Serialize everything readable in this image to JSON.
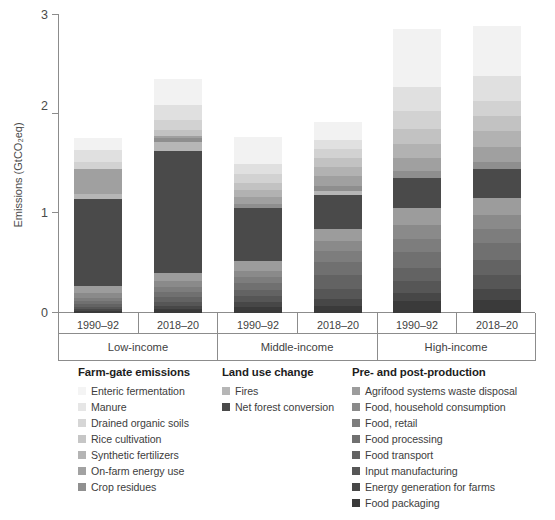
{
  "chart_data": {
    "type": "bar",
    "subtype": "stacked-bar-grouped",
    "title": "",
    "xlabel": "",
    "ylabel": "Emissions (GtCO₂eq)",
    "ylim": [
      0,
      3
    ],
    "yticks": [
      0,
      1,
      2,
      3
    ],
    "ytick_labels": [
      "0",
      "1",
      "2",
      "3"
    ],
    "grid": false,
    "legend_position": "below-plot",
    "groups": [
      "Low-income",
      "Middle-income",
      "High-income"
    ],
    "categories": [
      "1990–92",
      "2018–20",
      "1990–92",
      "2018–20",
      "1990–92",
      "2018–20"
    ],
    "bars": [
      {
        "group": "Low-income",
        "period": "1990–92",
        "total": 1.68
      },
      {
        "group": "Low-income",
        "period": "2018–20",
        "total": 2.65
      },
      {
        "group": "Middle-income",
        "period": "1990–92",
        "total": 1.66
      },
      {
        "group": "Middle-income",
        "period": "2018–20",
        "total": 1.87
      },
      {
        "group": "High-income",
        "period": "1990–92",
        "total": 2.75
      },
      {
        "group": "High-income",
        "period": "2018–20",
        "total": 2.83
      }
    ],
    "series": [
      {
        "name": "Enteric fermentation",
        "color": "#f2f2f2",
        "values": [
          0.12,
          0.26,
          0.27,
          0.18,
          0.58,
          0.5
        ]
      },
      {
        "name": "Manure",
        "color": "#e0e0e0",
        "values": [
          0.12,
          0.16,
          0.1,
          0.09,
          0.24,
          0.25
        ]
      },
      {
        "name": "Drained organic soils",
        "color": "#d2d2d2",
        "values": [
          0.07,
          0.1,
          0.09,
          0.09,
          0.19,
          0.16
        ]
      },
      {
        "name": "Rice cultivation",
        "color": "#c2c2c2",
        "values": [
          0.0,
          0.06,
          0.07,
          0.09,
          0.15,
          0.15
        ]
      },
      {
        "name": "Synthetic fertilizers",
        "color": "#b2b2b2",
        "values": [
          0.0,
          0.0,
          0.07,
          0.09,
          0.14,
          0.16
        ]
      },
      {
        "name": "On-farm energy use",
        "color": "#a0a0a0",
        "values": [
          0.25,
          0.02,
          0.07,
          0.1,
          0.13,
          0.15
        ]
      },
      {
        "name": "Crop residues",
        "color": "#8e8e8e",
        "values": [
          0.0,
          0.04,
          0.04,
          0.05,
          0.07,
          0.07
        ]
      },
      {
        "name": "Fires",
        "color": "#b6b6b6",
        "values": [
          0.05,
          0.09,
          0.0,
          0.04,
          0.0,
          0.0
        ]
      },
      {
        "name": "Net forest conversion",
        "color": "#4a4a4a",
        "values": [
          0.87,
          1.22,
          0.53,
          0.34,
          0.3,
          0.29
        ]
      },
      {
        "name": "Agrifood systems waste disposal",
        "color": "#9c9c9c",
        "values": [
          0.07,
          0.08,
          0.1,
          0.12,
          0.17,
          0.17
        ]
      },
      {
        "name": "Food, household consumption",
        "color": "#8a8a8a",
        "values": [
          0.05,
          0.06,
          0.06,
          0.1,
          0.14,
          0.14
        ]
      },
      {
        "name": "Food, retail",
        "color": "#7d7d7d",
        "values": [
          0.03,
          0.05,
          0.06,
          0.11,
          0.13,
          0.14
        ]
      },
      {
        "name": "Food processing",
        "color": "#707070",
        "values": [
          0.03,
          0.05,
          0.07,
          0.13,
          0.16,
          0.17
        ]
      },
      {
        "name": "Food transport",
        "color": "#636363",
        "values": [
          0.03,
          0.05,
          0.06,
          0.14,
          0.13,
          0.15
        ]
      },
      {
        "name": "Input manufacturing",
        "color": "#565656",
        "values": [
          0.02,
          0.04,
          0.06,
          0.1,
          0.12,
          0.14
        ]
      },
      {
        "name": "Energy generation for farms",
        "color": "#474747",
        "values": [
          0.02,
          0.03,
          0.05,
          0.07,
          0.08,
          0.11
        ]
      },
      {
        "name": "Food packaging",
        "color": "#3a3a3a",
        "values": [
          0.02,
          0.04,
          0.06,
          0.07,
          0.12,
          0.13
        ]
      }
    ]
  },
  "axis": {
    "ylabel": "Emissions (GtCO₂eq)",
    "ytick_0": "0",
    "ytick_1": "1",
    "ytick_2": "2",
    "ytick_3": "3"
  },
  "xaxis": {
    "periods": [
      {
        "label": "1990–92"
      },
      {
        "label": "2018–20"
      },
      {
        "label": "1990–92"
      },
      {
        "label": "2018–20"
      },
      {
        "label": "1990–92"
      },
      {
        "label": "2018–20"
      }
    ],
    "groups": [
      {
        "label": "Low-income"
      },
      {
        "label": "Middle-income"
      },
      {
        "label": "High-income"
      }
    ]
  },
  "legend": {
    "columns": [
      {
        "title": "Farm-gate emissions",
        "items": [
          {
            "label": "Enteric fermentation",
            "color": "#f4f4f4"
          },
          {
            "label": "Manure",
            "color": "#e6e6e6"
          },
          {
            "label": "Drained organic soils",
            "color": "#d6d6d6"
          },
          {
            "label": "Rice cultivation",
            "color": "#c6c6c6"
          },
          {
            "label": "Synthetic fertilizers",
            "color": "#b4b4b4"
          },
          {
            "label": "On-farm energy use",
            "color": "#a2a2a2"
          },
          {
            "label": "Crop residues",
            "color": "#909090"
          }
        ]
      },
      {
        "title": "Land use change",
        "items": [
          {
            "label": "Fires",
            "color": "#b6b6b6"
          },
          {
            "label": "Net forest conversion",
            "color": "#4a4a4a"
          }
        ]
      },
      {
        "title": "Pre- and post-production",
        "items": [
          {
            "label": "Agrifood systems waste disposal",
            "color": "#9c9c9c"
          },
          {
            "label": "Food, household consumption",
            "color": "#8a8a8a"
          },
          {
            "label": "Food, retail",
            "color": "#7d7d7d"
          },
          {
            "label": "Food processing",
            "color": "#707070"
          },
          {
            "label": "Food transport",
            "color": "#636363"
          },
          {
            "label": "Input manufacturing",
            "color": "#565656"
          },
          {
            "label": "Energy generation for farms",
            "color": "#474747"
          },
          {
            "label": "Food packaging",
            "color": "#3a3a3a"
          }
        ]
      }
    ]
  }
}
